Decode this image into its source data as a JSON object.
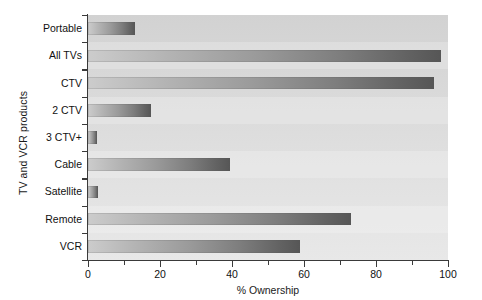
{
  "chart_data": {
    "type": "bar",
    "orientation": "horizontal",
    "title": "",
    "xlabel": "% Ownership",
    "ylabel": "TV and VCR products",
    "categories": [
      "Portable",
      "All TVs",
      "CTV",
      "2 CTV",
      "3 CTV+",
      "Cable",
      "Satellite",
      "Remote",
      "VCR"
    ],
    "values": [
      13,
      98,
      96,
      17.5,
      2.5,
      39.5,
      2.8,
      73,
      59
    ],
    "xlim": [
      0,
      100
    ],
    "xticks": [
      0,
      20,
      40,
      60,
      80,
      100
    ],
    "xtick_labels": [
      "0",
      "20",
      "40",
      "60",
      "80",
      "100"
    ],
    "xticks_minor": [
      10,
      30,
      50,
      70,
      90
    ],
    "grid": false,
    "legend": null,
    "bar_color_start": "#cccccc",
    "bar_color_end": "#565656",
    "plot_background": "#dcdcdc",
    "axis_color": "#3a3a3a"
  },
  "axes": {
    "y_title": "TV and VCR products",
    "x_title": "% Ownership"
  }
}
